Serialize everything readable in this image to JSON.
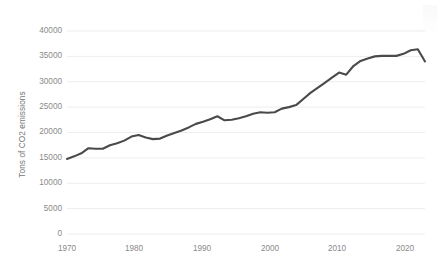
{
  "chart_data": {
    "type": "line",
    "title": "",
    "xlabel": "",
    "ylabel": "Tons of CO2 emissions",
    "xlim": [
      1970,
      2020
    ],
    "ylim": [
      0,
      40000
    ],
    "grid": true,
    "legend": false,
    "line_color": "#4a4a4a",
    "gridline_color": "#ededed",
    "tick_label_color": "#8a8a8a",
    "x_ticks": [
      "1970",
      "1980",
      "1990",
      "2000",
      "2010",
      "2020"
    ],
    "y_ticks": [
      "0",
      "5000",
      "10000",
      "15000",
      "20000",
      "25000",
      "30000",
      "35000",
      "40000"
    ],
    "series": [
      {
        "name": "Tons of CO2 emissions",
        "x": [
          1970,
          1971,
          1972,
          1973,
          1974,
          1975,
          1976,
          1977,
          1978,
          1979,
          1980,
          1981,
          1982,
          1983,
          1984,
          1985,
          1986,
          1987,
          1988,
          1989,
          1990,
          1991,
          1992,
          1993,
          1994,
          1995,
          1996,
          1997,
          1998,
          1999,
          2000,
          2001,
          2002,
          2003,
          2004,
          2005,
          2006,
          2007,
          2008,
          2009,
          2010,
          2011,
          2012,
          2013,
          2014,
          2015,
          2016,
          2017,
          2018,
          2019,
          2020
        ],
        "values": [
          14800,
          15300,
          15900,
          16900,
          16800,
          16800,
          17500,
          17900,
          18400,
          19200,
          19500,
          19000,
          18700,
          18800,
          19400,
          19900,
          20400,
          21000,
          21700,
          22100,
          22600,
          23200,
          22400,
          22500,
          22800,
          23200,
          23700,
          24000,
          23900,
          24000,
          24700,
          25000,
          25400,
          26600,
          27800,
          28800,
          29800,
          30800,
          31800,
          31400,
          33100,
          34100,
          34600,
          35000,
          35100,
          35100,
          35100,
          35500,
          36200,
          36400,
          34000
        ]
      }
    ]
  }
}
